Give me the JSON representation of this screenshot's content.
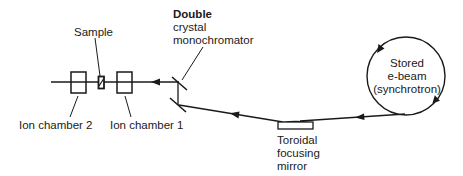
{
  "diagram": {
    "colors": {
      "stroke": "#1a1a1a",
      "background": "#ffffff"
    },
    "labels": {
      "sample": "Sample",
      "ion_chamber_2": "Ion chamber 2",
      "ion_chamber_1": "Ion chamber 1",
      "monochromator": [
        "Double",
        "crystal",
        "monochromator"
      ],
      "mirror": [
        "Toroidal",
        "focusing",
        "mirror"
      ],
      "source": [
        "Stored",
        "e-beam",
        "(synchrotron)"
      ]
    },
    "components": [
      {
        "id": "ion-chamber-2",
        "type": "box"
      },
      {
        "id": "sample",
        "type": "small-box"
      },
      {
        "id": "ion-chamber-1",
        "type": "box"
      },
      {
        "id": "double-crystal-monochromator",
        "type": "crystal-pair"
      },
      {
        "id": "toroidal-focusing-mirror",
        "type": "mirror"
      },
      {
        "id": "synchrotron-ring",
        "type": "circle"
      }
    ],
    "beam_direction": "right-to-left (synchrotron → mirror → monochromator → ion chamber 1 → sample → ion chamber 2)"
  }
}
